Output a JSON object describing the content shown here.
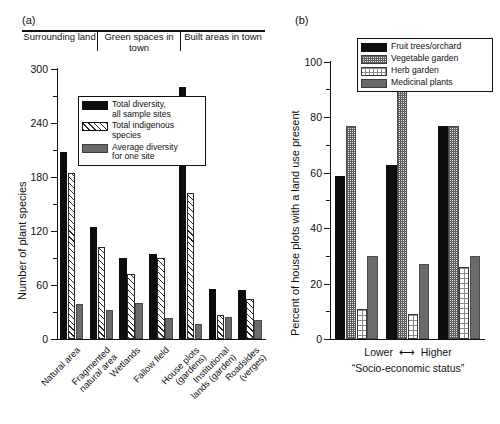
{
  "panel_a": {
    "letter": "(a)",
    "ylabel": "Number of plant species",
    "yticks": [
      0,
      60,
      120,
      180,
      240,
      300
    ],
    "ylim": [
      0,
      300
    ],
    "group_headers": [
      "Surrounding\nland",
      "Green spaces\nin town",
      "Built areas\nin town"
    ],
    "legend": [
      {
        "label": "Total diversity,\nall sample sites",
        "pattern": "black"
      },
      {
        "label": "Total indigenous\nspecies",
        "pattern": "hatch"
      },
      {
        "label": "Average diversity\nfor one site",
        "pattern": "gray"
      }
    ],
    "categories": [
      "Natural area",
      "Fragmented\nnatural area",
      "Wetlands",
      "Fallow field",
      "House plots\n(gardens)",
      "Institutional\nlands (garden)",
      "Roadsides\n(verges)"
    ]
  },
  "panel_b": {
    "letter": "(b)",
    "ylabel": "Percent of house plots with a land use present",
    "yticks": [
      0,
      20,
      40,
      60,
      80,
      100
    ],
    "ylim": [
      0,
      100
    ],
    "axis_lower": "Lower",
    "axis_arrow": "⟷",
    "axis_higher": "Higher",
    "axis_caption": "“Socio-economic status”",
    "legend": [
      {
        "label": "Fruit trees/orchard",
        "pattern": "black"
      },
      {
        "label": "Vegetable garden",
        "pattern": "checker"
      },
      {
        "label": "Herb garden",
        "pattern": "dots"
      },
      {
        "label": "Medicinal plants",
        "pattern": "gray"
      }
    ]
  },
  "chart_data": [
    {
      "type": "bar",
      "panel": "(a)",
      "title": "",
      "xlabel": "",
      "ylabel": "Number of plant species",
      "ylim": [
        0,
        300
      ],
      "yticks": [
        0,
        60,
        120,
        180,
        240,
        300
      ],
      "grid": false,
      "legend_position": "inside-top-center",
      "categories": [
        "Natural area",
        "Fragmented natural area",
        "Wetlands",
        "Fallow field",
        "House plots (gardens)",
        "Institutional lands (garden)",
        "Roadsides (verges)"
      ],
      "category_groups": [
        {
          "label": "Surrounding land",
          "categories": [
            "Natural area",
            "Fragmented natural area"
          ]
        },
        {
          "label": "Green spaces in town",
          "categories": [
            "Wetlands",
            "Fallow field"
          ]
        },
        {
          "label": "Built areas in town",
          "categories": [
            "House plots (gardens)",
            "Institutional lands (garden)",
            "Roadsides (verges)"
          ]
        }
      ],
      "series": [
        {
          "name": "Total diversity, all sample sites",
          "values": [
            208,
            125,
            90,
            95,
            280,
            56,
            55
          ]
        },
        {
          "name": "Total indigenous species",
          "values": [
            184,
            102,
            72,
            90,
            162,
            27,
            44
          ]
        },
        {
          "name": "Average diversity for one site",
          "values": [
            39,
            32,
            40,
            23,
            17,
            24,
            21
          ]
        }
      ]
    },
    {
      "type": "bar",
      "panel": "(b)",
      "title": "",
      "xlabel": "“Socio-economic status”",
      "ylabel": "Percent of house plots with a land use present",
      "ylim": [
        0,
        100
      ],
      "yticks": [
        0,
        20,
        40,
        60,
        80,
        100
      ],
      "grid": false,
      "legend_position": "inside-top-right",
      "categories": [
        "Lower",
        "Middle",
        "Higher"
      ],
      "series": [
        {
          "name": "Fruit trees/orchard",
          "values": [
            59,
            63,
            77
          ]
        },
        {
          "name": "Vegetable garden",
          "values": [
            77,
            90,
            77
          ]
        },
        {
          "name": "Herb garden",
          "values": [
            11,
            9,
            26
          ]
        },
        {
          "name": "Medicinal plants",
          "values": [
            30,
            27,
            30
          ]
        }
      ]
    }
  ]
}
